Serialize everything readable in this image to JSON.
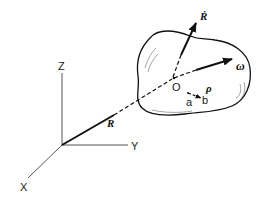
{
  "diagram": {
    "axes": {
      "x_label": "X",
      "y_label": "Y",
      "z_label": "Z"
    },
    "vectors": {
      "position": "R",
      "velocity": "Ṙ",
      "angular_velocity": "ω",
      "relative": "ρ"
    },
    "points": {
      "body_origin": "O",
      "point_a": "a",
      "point_b": "b"
    },
    "colors": {
      "ink": "#111111",
      "background": "#ffffff"
    }
  }
}
